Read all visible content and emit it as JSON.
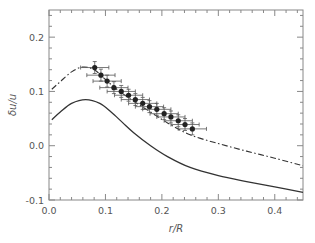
{
  "chart_data": {
    "type": "line",
    "title": "",
    "xlabel": "r/R",
    "ylabel": "δu/u",
    "xlim": [
      0.0,
      0.45
    ],
    "ylim": [
      -0.1,
      0.25
    ],
    "xticks": [
      0.0,
      0.1,
      0.2,
      0.3,
      0.4
    ],
    "xtick_labels": [
      "0.0",
      "0.1",
      "0.2",
      "0.3",
      "0.4"
    ],
    "yticks": [
      -0.1,
      0.0,
      0.1,
      0.2
    ],
    "ytick_labels": [
      "-0.1",
      "0.0",
      "0.1",
      "0.2"
    ],
    "grid": false,
    "legend": null,
    "series": [
      {
        "name": "measurements",
        "style": "points-with-xy-errorbars",
        "color": "#222222",
        "x": [
          0.081,
          0.092,
          0.103,
          0.115,
          0.128,
          0.141,
          0.153,
          0.166,
          0.178,
          0.191,
          0.204,
          0.216,
          0.229,
          0.241,
          0.254
        ],
        "y": [
          0.144,
          0.13,
          0.119,
          0.107,
          0.1,
          0.093,
          0.085,
          0.078,
          0.072,
          0.067,
          0.059,
          0.053,
          0.046,
          0.039,
          0.031
        ],
        "xerr": 0.025,
        "yerr": 0.011
      },
      {
        "name": "dash-dot curve",
        "style": "dashdot",
        "color": "#333333",
        "x": [
          0.005,
          0.02,
          0.04,
          0.06,
          0.08,
          0.1,
          0.12,
          0.15,
          0.18,
          0.21,
          0.25,
          0.3,
          0.35,
          0.4,
          0.45
        ],
        "y": [
          0.104,
          0.118,
          0.136,
          0.145,
          0.14,
          0.122,
          0.104,
          0.082,
          0.062,
          0.042,
          0.02,
          0.004,
          -0.01,
          -0.023,
          -0.037
        ]
      },
      {
        "name": "solid curve",
        "style": "solid",
        "color": "#333333",
        "x": [
          0.005,
          0.02,
          0.04,
          0.065,
          0.09,
          0.11,
          0.13,
          0.15,
          0.18,
          0.21,
          0.25,
          0.3,
          0.35,
          0.4,
          0.45
        ],
        "y": [
          0.048,
          0.062,
          0.078,
          0.085,
          0.078,
          0.062,
          0.043,
          0.024,
          0.0,
          -0.02,
          -0.04,
          -0.055,
          -0.066,
          -0.076,
          -0.086
        ]
      }
    ]
  }
}
